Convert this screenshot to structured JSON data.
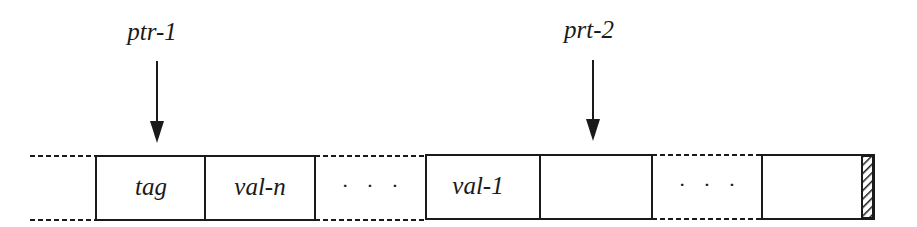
{
  "diagram": {
    "pointers": [
      {
        "label": "ptr-1",
        "target": "tag"
      },
      {
        "label": "prt-2",
        "target": "empty cell after val-1"
      }
    ],
    "cells": [
      {
        "label": "tag"
      },
      {
        "label": "val-n"
      },
      {
        "label": "· · ·",
        "kind": "ellipsis-gap"
      },
      {
        "label": "val-1"
      },
      {
        "label": "",
        "kind": "empty"
      },
      {
        "label": "· · ·",
        "kind": "ellipsis-gap"
      },
      {
        "label": "",
        "kind": "empty-with-hatched-end"
      }
    ],
    "colors": {
      "stroke": "#1a1a1a",
      "background": "#ffffff"
    }
  }
}
